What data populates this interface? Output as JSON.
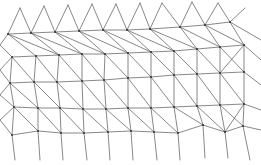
{
  "diagram": {
    "type": "triangular-mesh",
    "width": 261,
    "height": 165,
    "background": "#ffffff",
    "edge_color": "#555555",
    "node_color": "#333333",
    "rows": [
      [
        [
          8,
          34
        ],
        [
          31,
          33
        ],
        [
          55,
          32
        ],
        [
          79,
          31
        ],
        [
          103,
          30
        ],
        [
          127,
          30
        ],
        [
          150,
          29
        ],
        [
          180,
          27
        ],
        [
          205,
          25
        ],
        [
          230,
          22
        ]
      ],
      [
        [
          12,
          57
        ],
        [
          36,
          56
        ],
        [
          59,
          55
        ],
        [
          82,
          54
        ],
        [
          105,
          54
        ],
        [
          128,
          53
        ],
        [
          151,
          52
        ],
        [
          174,
          51
        ],
        [
          197,
          49
        ],
        [
          220,
          47
        ],
        [
          244,
          45
        ]
      ],
      [
        [
          10,
          83
        ],
        [
          34,
          82
        ],
        [
          57,
          82
        ],
        [
          82,
          81
        ],
        [
          104,
          80
        ],
        [
          128,
          78
        ],
        [
          151,
          77
        ],
        [
          174,
          75
        ],
        [
          197,
          74
        ],
        [
          220,
          73
        ],
        [
          244,
          72
        ]
      ],
      [
        [
          14,
          107
        ],
        [
          38,
          108
        ],
        [
          60,
          108
        ],
        [
          83,
          109
        ],
        [
          106,
          109
        ],
        [
          128,
          108
        ],
        [
          151,
          108
        ],
        [
          174,
          107
        ],
        [
          197,
          106
        ],
        [
          220,
          105
        ],
        [
          244,
          104
        ]
      ],
      [
        [
          12,
          135
        ],
        [
          38,
          131
        ],
        [
          61,
          133
        ],
        [
          84,
          133
        ],
        [
          108,
          132
        ],
        [
          131,
          131
        ],
        [
          154,
          132
        ],
        [
          178,
          133
        ],
        [
          203,
          125
        ],
        [
          225,
          132
        ],
        [
          243,
          126
        ]
      ]
    ],
    "top_stubs": [
      [
        20,
        8
      ],
      [
        44,
        6
      ],
      [
        68,
        5
      ],
      [
        92,
        4
      ],
      [
        116,
        4
      ],
      [
        140,
        3
      ],
      [
        162,
        3
      ],
      [
        192,
        2
      ],
      [
        218,
        3
      ],
      [
        245,
        8
      ]
    ],
    "bottom_stubs": [
      [
        15,
        160
      ],
      [
        40,
        160
      ],
      [
        63,
        160
      ],
      [
        87,
        160
      ],
      [
        110,
        160
      ],
      [
        133,
        160
      ],
      [
        157,
        160
      ],
      [
        180,
        160
      ],
      [
        205,
        158
      ],
      [
        228,
        158
      ],
      [
        250,
        160
      ]
    ],
    "left_stubs": [
      [
        0,
        45
      ],
      [
        0,
        70
      ],
      [
        0,
        95
      ],
      [
        0,
        120
      ]
    ],
    "right_stubs": [
      [
        261,
        40
      ],
      [
        261,
        60
      ],
      [
        261,
        85
      ],
      [
        261,
        110
      ],
      [
        261,
        130
      ]
    ]
  }
}
